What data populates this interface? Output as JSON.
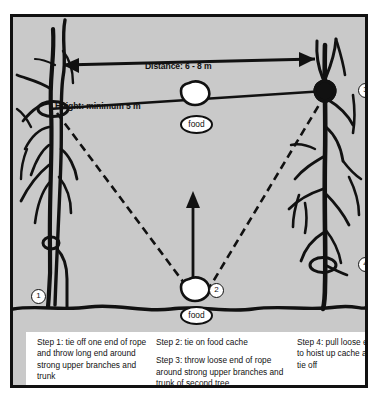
{
  "figure": {
    "background_color": "#c9c9c9",
    "border_color": "#111111",
    "ink_color": "#111111",
    "panel_color": "#ffffff"
  },
  "measurements": {
    "distance_label": "Distance: 6 - 8 m",
    "height_label": "Height: minimum 5 m",
    "distance_value_min": 6,
    "distance_value_max": 8,
    "distance_unit": "m",
    "height_value_min": 5,
    "height_unit": "m"
  },
  "food_tags": {
    "hung": "food",
    "ground": "food"
  },
  "callouts": [
    {
      "id": 1,
      "number": "1",
      "position": "base of left tree"
    },
    {
      "id": 2,
      "number": "2",
      "position": "food cache on ground"
    },
    {
      "id": 3,
      "number": "3",
      "position": "upper branch of right tree"
    },
    {
      "id": 4,
      "number": "4",
      "position": "lower trunk of right tree"
    }
  ],
  "steps": {
    "column_1": [
      "Step 1: tie off one end of rope and throw long end around strong upper branches and trunk"
    ],
    "column_2": [
      "Step 2: tie on food cache",
      "Step 3: throw loose end of rope around strong upper branches and trunk of second tree"
    ],
    "column_3": [
      "Step 4: pull loose end to hoist up cache and tie off"
    ]
  }
}
